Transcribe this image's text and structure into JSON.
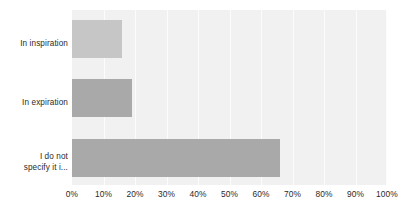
{
  "chart_data": {
    "type": "bar",
    "orientation": "horizontal",
    "title": "",
    "xlabel": "",
    "ylabel": "",
    "categories": [
      "In inspiration",
      "In expiration",
      "I do not specify it i..."
    ],
    "values": [
      16,
      19,
      66
    ],
    "value_suffix": "%",
    "xlim": [
      0,
      100
    ],
    "ticks": [
      "0%",
      "10%",
      "20%",
      "30%",
      "40%",
      "50%",
      "60%",
      "70%",
      "80%",
      "90%",
      "100%"
    ],
    "tick_values": [
      0,
      10,
      20,
      30,
      40,
      50,
      60,
      70,
      80,
      90,
      100
    ],
    "grid": true,
    "grid_axis": "x",
    "legend": false,
    "bar_colors": [
      "#c6c6c6",
      "#a9a9a9",
      "#a9a9a9"
    ],
    "plot_background": "#f1f1f1",
    "gridline_color": "#fcfcfc",
    "label_color": "#2b2b2b"
  },
  "category_labels": [
    {
      "text": "In inspiration"
    },
    {
      "text": "In expiration"
    },
    {
      "text": "I do not\nspecify it i..."
    }
  ]
}
